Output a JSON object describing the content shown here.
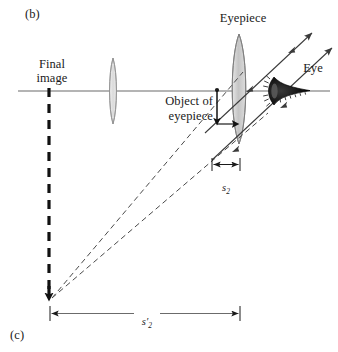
{
  "figure": {
    "panel_current": "(b)",
    "panel_next": "(c)",
    "axis_color": "#5a5a5a",
    "ink_color": "#1a1a1a",
    "lens_fill": "#c9c9c9",
    "ray_color": "#4a4a4a"
  },
  "labels": {
    "final_image": "Final\nimage",
    "eyepiece": "Eyepiece",
    "eye": "Eye",
    "object_of_eyepiece": "Object of\neyepiece"
  },
  "dimensions": {
    "s2": {
      "symbol": "s",
      "subscript": "2",
      "prime": ""
    },
    "s2_prime": {
      "symbol": "s",
      "subscript": "2",
      "prime": "′"
    }
  },
  "geometry": {
    "axis_y": 91,
    "objective_lens_x": 113,
    "eyepiece_lens_x": 239,
    "final_image_x": 49,
    "object_x": 217,
    "eye_x": 272,
    "converge_x": 51,
    "converge_y": 299
  }
}
